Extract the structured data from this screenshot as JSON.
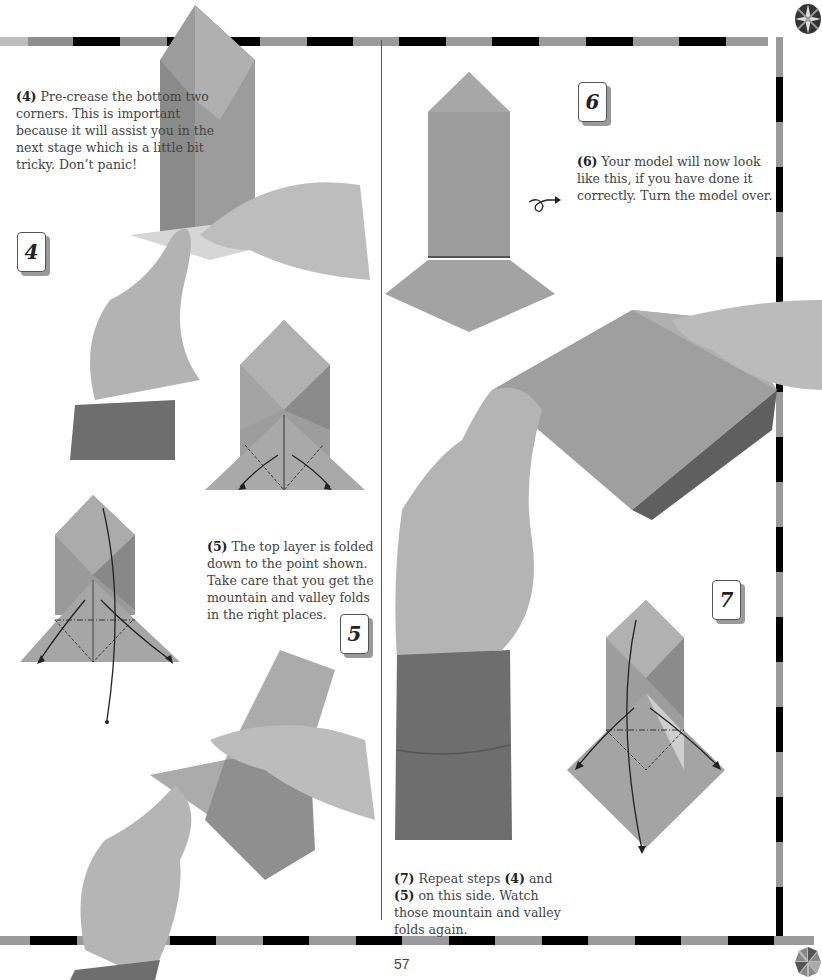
{
  "page": {
    "page_number": "57",
    "colors": {
      "paper_gray": "#9a9a9a",
      "paper_dark": "#7c7c7c",
      "border_black": "#000000",
      "border_gray": "#999999",
      "skin": "#b8b8b8",
      "sleeve": "#6e6e6e"
    }
  },
  "steps": [
    {
      "number": "4",
      "caption_label": "(4)",
      "caption_text": " Pre-crease the bottom two corners. This is important because it will assist you in the next stage which is a little bit tricky. Don’t panic!"
    },
    {
      "number": "5",
      "caption_label": "(5)",
      "caption_text": " The top layer is folded down to the point shown. Take care that you get the mountain and valley folds in the right places."
    },
    {
      "number": "6",
      "caption_label": "(6)",
      "caption_text": " Your model will now look like this, if you have done it correctly. Turn the model over."
    },
    {
      "number": "7",
      "caption_label": "(7)",
      "caption_text_a": " Repeat steps ",
      "caption_ref_a": "(4)",
      "caption_text_b": " and ",
      "caption_ref_b": "(5)",
      "caption_text_c": " on this side. Watch those mountain and valley folds again."
    }
  ],
  "icons": {
    "corner_top": "origami-rosette-icon",
    "corner_bottom": "origami-rosette-icon",
    "turn_over": "turn-over-arrow-icon"
  }
}
